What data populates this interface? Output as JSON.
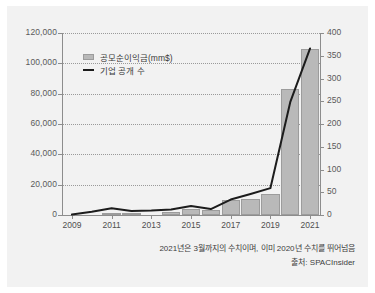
{
  "chart_data": {
    "type": "bar",
    "title": "",
    "subtitle": "",
    "x": [
      2009,
      2010,
      2011,
      2012,
      2013,
      2014,
      2015,
      2016,
      2017,
      2018,
      2019,
      2020,
      2021
    ],
    "categories": [
      "2009",
      "2010",
      "2011",
      "2012",
      "2013",
      "2014",
      "2015",
      "2016",
      "2017",
      "2018",
      "2019",
      "2020",
      "2021"
    ],
    "series": [
      {
        "name": "공모순이익금(mm$)",
        "type": "bar",
        "axis": "left",
        "values": [
          36,
          36,
          1081,
          491,
          145,
          1750,
          3902,
          3499,
          10049,
          10752,
          13608,
          83380,
          109200
        ]
      },
      {
        "name": "기업 공개 수",
        "type": "line",
        "axis": "right",
        "values": [
          1,
          7,
          15,
          9,
          10,
          12,
          20,
          13,
          34,
          46,
          59,
          248,
          366
        ]
      }
    ],
    "xlabel": "",
    "ylabel": "",
    "ylim": [
      0,
      120000
    ],
    "y2lim": [
      0,
      400
    ],
    "yticks": [
      "0",
      "20,000",
      "40,000",
      "60,000",
      "80,000",
      "100,000",
      "120,000"
    ],
    "y2ticks": [
      "0",
      "50",
      "100",
      "150",
      "200",
      "250",
      "300",
      "350",
      "400"
    ],
    "xticks": [
      "2009",
      "2011",
      "2013",
      "2015",
      "2017",
      "2019",
      "2021"
    ],
    "grid": true,
    "legend_position": "upper-left",
    "annotations": [
      "2021년은 3월까지의 수치이며, 이미 2020년 수치를 뛰어넘음",
      "출처: SPACInsider"
    ]
  },
  "legend": {
    "items": [
      {
        "label": "공모순이익금(mm$)",
        "marker": "bar-swatch"
      },
      {
        "label": "기업 공개 수",
        "marker": "line-swatch"
      }
    ]
  },
  "footnote": {
    "note": "2021년은 3월까지의 수치이며, 이미 2020년 수치를 뛰어넘음",
    "source": "출처: SPACInsider"
  },
  "colors": {
    "figure_background": "#f2f2f2",
    "page_background": "#ffffff",
    "bar_fill": "#b9b9b9",
    "bar_stroke": "#9c9c9c",
    "line_stroke": "#1c1c1c",
    "grid": "#9a9a9a",
    "axis": "#8d8d8d",
    "tick_label": "#5a5a5a"
  }
}
